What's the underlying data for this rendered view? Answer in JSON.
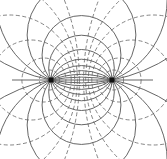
{
  "diagram": {
    "type": "electric dipole field lines and equipotentials",
    "charges": [
      {
        "x": 51,
        "y": 80
      },
      {
        "x": 112,
        "y": 80
      }
    ],
    "field_line_offsets": [
      0,
      12,
      25,
      45,
      80,
      160
    ],
    "equipotential_radii": [
      10,
      22,
      40,
      65,
      110,
      220
    ],
    "colors": {
      "field": "#555555",
      "equipotential": "#666666",
      "charge": "#111111"
    }
  }
}
